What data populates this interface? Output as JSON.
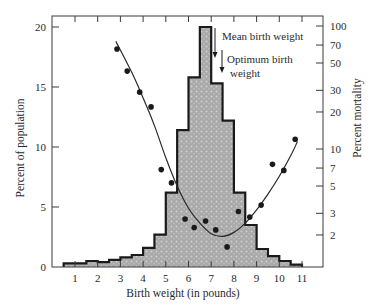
{
  "chart_data": {
    "type": "bar",
    "title": "",
    "xlabel": "Birth weight (in pounds)",
    "ylabel": "Percent of population",
    "y2label": "Percent mortality",
    "xlim": [
      0.5,
      11.5
    ],
    "ylim": [
      0,
      20
    ],
    "y2lim_log": [
      1.2,
      100
    ],
    "x_ticks": [
      1,
      2,
      3,
      4,
      5,
      6,
      7,
      8,
      9,
      10,
      11
    ],
    "y_ticks": [
      0,
      5,
      10,
      15,
      20
    ],
    "y2_ticks": [
      2,
      3,
      5,
      7,
      10,
      20,
      30,
      50,
      70,
      100
    ],
    "grid": false,
    "histogram": {
      "name": "Percent of population",
      "bin_width": 0.5,
      "bins": [
        {
          "x0": 0.5,
          "x1": 1.0,
          "value": 0.3
        },
        {
          "x0": 1.0,
          "x1": 1.5,
          "value": 0.3
        },
        {
          "x0": 1.5,
          "x1": 2.0,
          "value": 0.5
        },
        {
          "x0": 2.0,
          "x1": 2.5,
          "value": 0.4
        },
        {
          "x0": 2.5,
          "x1": 3.0,
          "value": 0.6
        },
        {
          "x0": 3.0,
          "x1": 3.5,
          "value": 0.8
        },
        {
          "x0": 3.5,
          "x1": 4.0,
          "value": 1.0
        },
        {
          "x0": 4.0,
          "x1": 4.5,
          "value": 1.6
        },
        {
          "x0": 4.5,
          "x1": 5.0,
          "value": 2.7
        },
        {
          "x0": 5.0,
          "x1": 5.5,
          "value": 6.2
        },
        {
          "x0": 5.5,
          "x1": 6.0,
          "value": 11.4
        },
        {
          "x0": 6.0,
          "x1": 6.5,
          "value": 15.8
        },
        {
          "x0": 6.5,
          "x1": 7.0,
          "value": 20.0
        },
        {
          "x0": 7.0,
          "x1": 7.5,
          "value": 15.3
        },
        {
          "x0": 7.5,
          "x1": 8.0,
          "value": 12.2
        },
        {
          "x0": 8.0,
          "x1": 8.5,
          "value": 6.2
        },
        {
          "x0": 8.5,
          "x1": 9.0,
          "value": 3.5
        },
        {
          "x0": 9.0,
          "x1": 9.5,
          "value": 1.5
        },
        {
          "x0": 9.5,
          "x1": 10.0,
          "value": 0.9
        },
        {
          "x0": 10.0,
          "x1": 10.5,
          "value": 0.5
        },
        {
          "x0": 10.5,
          "x1": 11.0,
          "value": 0.2
        }
      ]
    },
    "mortality_points": {
      "name": "Percent mortality (log scale)",
      "x": [
        2.85,
        3.3,
        3.85,
        4.35,
        4.8,
        5.25,
        5.85,
        6.25,
        6.75,
        7.2,
        7.7,
        8.2,
        8.7,
        9.2,
        9.7,
        10.2,
        10.7
      ],
      "y": [
        65,
        43,
        29,
        22,
        6.8,
        5.3,
        2.7,
        2.3,
        2.6,
        2.2,
        1.6,
        3.1,
        2.8,
        3.5,
        7.5,
        6.7,
        12
      ]
    },
    "fit_curve": {
      "name": "Fitted mortality curve",
      "x": [
        2.8,
        3.5,
        4.0,
        4.5,
        5.0,
        5.5,
        6.0,
        6.5,
        7.0,
        7.5,
        8.0,
        8.5,
        9.0,
        9.5,
        10.0,
        10.5,
        10.8
      ],
      "y": [
        75,
        42,
        26,
        15.5,
        8.5,
        5.0,
        3.3,
        2.5,
        2.05,
        1.95,
        2.1,
        2.5,
        3.2,
        4.3,
        6.0,
        8.8,
        11.5
      ]
    },
    "annotations": [
      {
        "label": "Mean birth weight",
        "x": 7.0,
        "text_line": "Mean birth weight"
      },
      {
        "label": "Optimum birth weight",
        "x": 7.3,
        "text_lines": [
          "Optimum birth",
          "weight"
        ]
      }
    ]
  },
  "labels": {
    "xlabel": "Birth weight (in pounds)",
    "ylabel": "Percent of population",
    "y2label": "Percent mortality",
    "mean_label": "Mean birth weight",
    "optimum_line1": "Optimum birth",
    "optimum_line2": "weight"
  },
  "colors": {
    "bar_fill": "#a9a9a9",
    "bar_dots": "#d4d4d4",
    "outline": "#1a1a1a",
    "axis": "#3a3a3a",
    "points": "#1a1a1a"
  }
}
